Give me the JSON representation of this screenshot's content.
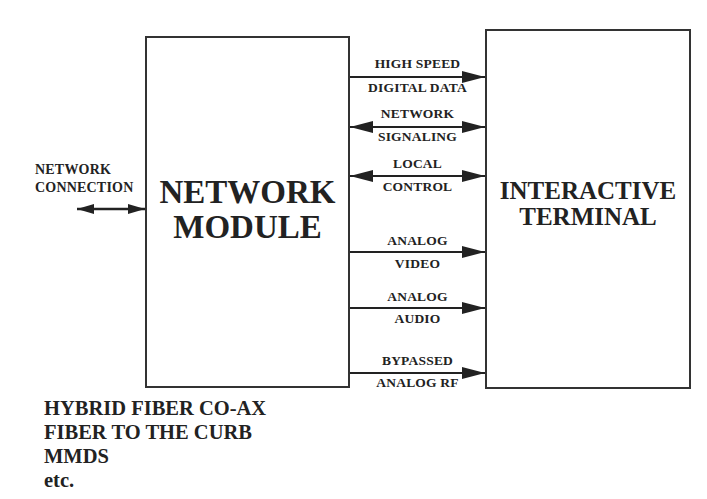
{
  "diagram": {
    "network_connection": {
      "label_line1": "NETWORK",
      "label_line2": "CONNECTION",
      "arrow": "bidirectional"
    },
    "network_module": {
      "title_line1": "NETWORK",
      "title_line2": "MODULE"
    },
    "interactive_terminal": {
      "title_line1": "INTERACTIVE",
      "title_line2": "TERMINAL"
    },
    "signals": [
      {
        "top": "HIGH SPEED",
        "bottom": "DIGITAL DATA",
        "direction": "to-terminal"
      },
      {
        "top": "NETWORK",
        "bottom": "SIGNALING",
        "direction": "bidirectional"
      },
      {
        "top": "LOCAL",
        "bottom": "CONTROL",
        "direction": "bidirectional"
      },
      {
        "top": "ANALOG",
        "bottom": "VIDEO",
        "direction": "to-terminal"
      },
      {
        "top": "ANALOG",
        "bottom": "AUDIO",
        "direction": "to-terminal"
      },
      {
        "top": "BYPASSED",
        "bottom": "ANALOG RF",
        "direction": "to-terminal"
      }
    ],
    "network_types": [
      "HYBRID FIBER CO-AX",
      "FIBER TO THE CURB",
      "MMDS",
      "etc."
    ]
  }
}
